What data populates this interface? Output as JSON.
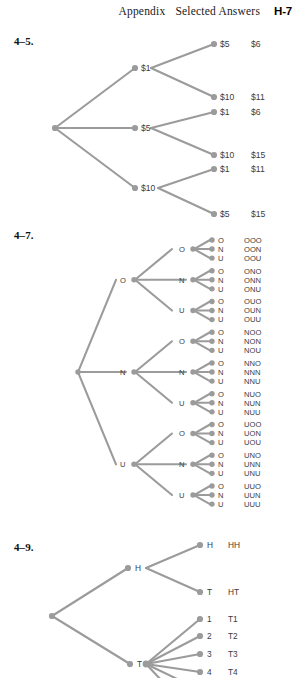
{
  "header": {
    "appendix": "Appendix",
    "title": "Selected Answers",
    "folio": "H-7"
  },
  "problems": [
    {
      "number": "4–5.",
      "type": "tree-diagram",
      "description": "Two-stage money tree: first pick $1, $5 or $10, then a second pick; outcome column shows the total.",
      "root": "",
      "branches": [
        {
          "label": "$1",
          "children": [
            {
              "label": "$5",
              "outcome": "$6"
            },
            {
              "label": "$10",
              "outcome": "$11"
            }
          ]
        },
        {
          "label": "$5",
          "children": [
            {
              "label": "$1",
              "outcome": "$6"
            },
            {
              "label": "$10",
              "outcome": "$15"
            }
          ]
        },
        {
          "label": "$10",
          "children": [
            {
              "label": "$1",
              "outcome": "$11"
            },
            {
              "label": "$5",
              "outcome": "$15"
            }
          ]
        }
      ]
    },
    {
      "number": "4–7.",
      "type": "tree-diagram",
      "description": "Three-stage tree over the letters O, N, U giving all 27 ordered triples.",
      "root": "",
      "branches": [
        {
          "label": "O",
          "children": [
            {
              "label": "O",
              "children": [
                {
                  "label": "O",
                  "outcome": "OOO"
                },
                {
                  "label": "N",
                  "outcome": "OON"
                },
                {
                  "label": "U",
                  "outcome": "OOU"
                }
              ]
            },
            {
              "label": "N",
              "children": [
                {
                  "label": "O",
                  "outcome": "ONO"
                },
                {
                  "label": "N",
                  "outcome": "ONN"
                },
                {
                  "label": "U",
                  "outcome": "ONU"
                }
              ]
            },
            {
              "label": "U",
              "children": [
                {
                  "label": "O",
                  "outcome": "OUO"
                },
                {
                  "label": "N",
                  "outcome": "OUN"
                },
                {
                  "label": "U",
                  "outcome": "OUU"
                }
              ]
            }
          ]
        },
        {
          "label": "N",
          "children": [
            {
              "label": "O",
              "children": [
                {
                  "label": "O",
                  "outcome": "NOO"
                },
                {
                  "label": "N",
                  "outcome": "NON"
                },
                {
                  "label": "U",
                  "outcome": "NOU"
                }
              ]
            },
            {
              "label": "N",
              "children": [
                {
                  "label": "O",
                  "outcome": "NNO"
                },
                {
                  "label": "N",
                  "outcome": "NNN"
                },
                {
                  "label": "U",
                  "outcome": "NNU"
                }
              ]
            },
            {
              "label": "U",
              "children": [
                {
                  "label": "O",
                  "outcome": "NUO"
                },
                {
                  "label": "N",
                  "outcome": "NUN"
                },
                {
                  "label": "U",
                  "outcome": "NUU"
                }
              ]
            }
          ]
        },
        {
          "label": "U",
          "children": [
            {
              "label": "O",
              "children": [
                {
                  "label": "O",
                  "outcome": "UOO"
                },
                {
                  "label": "N",
                  "outcome": "UON"
                },
                {
                  "label": "U",
                  "outcome": "UOU"
                }
              ]
            },
            {
              "label": "N",
              "children": [
                {
                  "label": "O",
                  "outcome": "UNO"
                },
                {
                  "label": "N",
                  "outcome": "UNN"
                },
                {
                  "label": "U",
                  "outcome": "UNU"
                }
              ]
            },
            {
              "label": "U",
              "children": [
                {
                  "label": "O",
                  "outcome": "UUO"
                },
                {
                  "label": "N",
                  "outcome": "UUN"
                },
                {
                  "label": "U",
                  "outcome": "UUU"
                }
              ]
            }
          ]
        }
      ]
    },
    {
      "number": "4–9.",
      "type": "tree-diagram",
      "description": "Coin then coin-or-die tree; figure is cut off by the bottom of the page.",
      "root": "",
      "branches": [
        {
          "label": "H",
          "children": [
            {
              "label": "H",
              "outcome": "HH"
            },
            {
              "label": "T",
              "outcome": "HT"
            }
          ]
        },
        {
          "label": "T",
          "children": [
            {
              "label": "1",
              "outcome": "T1"
            },
            {
              "label": "2",
              "outcome": "T2"
            },
            {
              "label": "3",
              "outcome": "T3"
            },
            {
              "label": "4",
              "outcome": "T4"
            }
          ]
        }
      ]
    }
  ],
  "colors": {
    "line": "#9b9b9b",
    "node": "#9b9b9b",
    "label": "#3c3c3c",
    "text": "#111111",
    "background": "#ffffff"
  }
}
